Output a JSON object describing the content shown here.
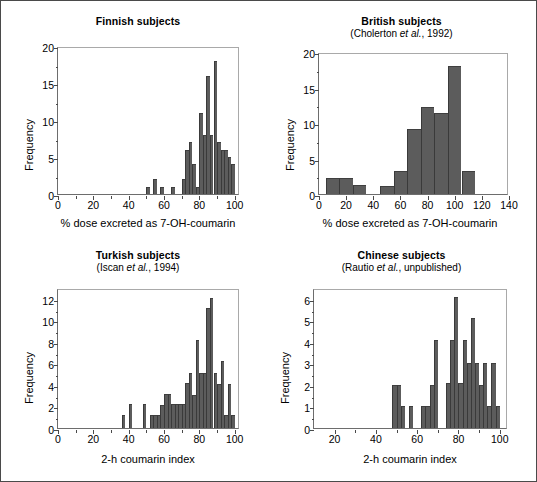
{
  "figure": {
    "background": "#ffffff",
    "border_color": "#4a4a4a",
    "bar_color": "#5c5c5c",
    "bar_edge_color": "#3a3a3a",
    "axis_color": "#4a4a4a"
  },
  "panels": [
    {
      "key": "finnish",
      "title": "Finnish subjects",
      "subtitle": ""
    },
    {
      "key": "british",
      "title": "British subjects",
      "subtitle_prefix": "(Cholerton ",
      "subtitle_italic": "et al.",
      "subtitle_suffix": ", 1992)"
    },
    {
      "key": "turkish",
      "title": "Turkish subjects",
      "subtitle_prefix": "(Iscan ",
      "subtitle_italic": "et al.",
      "subtitle_suffix": ", 1994)"
    },
    {
      "key": "chinese",
      "title": "Chinese subjects",
      "subtitle_prefix": "(Rautio ",
      "subtitle_italic": "et al.",
      "subtitle_suffix": ", unpublished)"
    }
  ],
  "chart_data": [
    {
      "id": "finnish",
      "type": "bar",
      "title": "Finnish subjects",
      "subtitle": "",
      "xlabel": "% dose excreted as 7-OH-coumarin",
      "ylabel": "Frequency",
      "xlim": [
        0,
        103
      ],
      "ylim": [
        0,
        20
      ],
      "xticks": [
        0,
        20,
        40,
        60,
        80,
        100
      ],
      "xticklabels": [
        "0",
        "20",
        "40",
        "60",
        "80",
        "100"
      ],
      "xminorticks": [
        10,
        30,
        50,
        70,
        90
      ],
      "yticks": [
        0,
        5,
        10,
        15,
        20
      ],
      "yticklabels": [
        "0",
        "5",
        "10",
        "15",
        "20"
      ],
      "grid": false,
      "legend": null,
      "bin_width": 2,
      "bins": [
        {
          "x": 50,
          "value": 1
        },
        {
          "x": 54,
          "value": 2
        },
        {
          "x": 58,
          "value": 1
        },
        {
          "x": 64,
          "value": 1
        },
        {
          "x": 70,
          "value": 2
        },
        {
          "x": 72,
          "value": 6
        },
        {
          "x": 74,
          "value": 7
        },
        {
          "x": 76,
          "value": 4
        },
        {
          "x": 78,
          "value": 1
        },
        {
          "x": 80,
          "value": 11
        },
        {
          "x": 82,
          "value": 8
        },
        {
          "x": 84,
          "value": 16
        },
        {
          "x": 86,
          "value": 8
        },
        {
          "x": 88,
          "value": 18
        },
        {
          "x": 90,
          "value": 7
        },
        {
          "x": 92,
          "value": 6
        },
        {
          "x": 94,
          "value": 6
        },
        {
          "x": 96,
          "value": 5
        },
        {
          "x": 98,
          "value": 4
        }
      ]
    },
    {
      "id": "british",
      "type": "bar",
      "title": "British subjects",
      "subtitle": "(Cholerton et al., 1992)",
      "xlabel": "% dose excreted as 7-OH-coumarin",
      "ylabel": "Frequency",
      "xlim": [
        0,
        140
      ],
      "ylim": [
        0,
        20
      ],
      "xticks": [
        0,
        20,
        40,
        60,
        80,
        100,
        120,
        140
      ],
      "xticklabels": [
        "0",
        "20",
        "40",
        "60",
        "80",
        "100",
        "120",
        "140"
      ],
      "yticks": [
        0,
        5,
        10,
        15,
        20
      ],
      "yticklabels": [
        "0",
        "5",
        "10",
        "15",
        "20"
      ],
      "grid": false,
      "legend": null,
      "bin_width": 10,
      "bins": [
        {
          "x": 5,
          "value": 2.2
        },
        {
          "x": 15,
          "value": 2.2
        },
        {
          "x": 25,
          "value": 1.3
        },
        {
          "x": 45,
          "value": 1.1
        },
        {
          "x": 55,
          "value": 3.3
        },
        {
          "x": 65,
          "value": 9.2
        },
        {
          "x": 75,
          "value": 12.3
        },
        {
          "x": 85,
          "value": 11.4
        },
        {
          "x": 95,
          "value": 18.0
        },
        {
          "x": 105,
          "value": 3.3
        }
      ]
    },
    {
      "id": "turkish",
      "type": "bar",
      "title": "Turkish subjects",
      "subtitle": "(Iscan et al., 1994)",
      "xlabel": "2-h coumarin index",
      "ylabel": "Frequency",
      "xlim": [
        0,
        103
      ],
      "ylim": [
        0,
        13
      ],
      "xticks": [
        0,
        20,
        40,
        60,
        80,
        100
      ],
      "xticklabels": [
        "0",
        "20",
        "40",
        "60",
        "80",
        "100"
      ],
      "xminorticks": [
        10,
        30,
        50,
        70,
        90
      ],
      "yticks": [
        0,
        2,
        4,
        6,
        8,
        10,
        12
      ],
      "yticklabels": [
        "0",
        "2",
        "4",
        "6",
        "8",
        "10",
        "12"
      ],
      "grid": false,
      "legend": null,
      "bin_width": 2,
      "bins": [
        {
          "x": 36,
          "value": 1.2
        },
        {
          "x": 40,
          "value": 2.2
        },
        {
          "x": 48,
          "value": 2.2
        },
        {
          "x": 52,
          "value": 1.2
        },
        {
          "x": 54,
          "value": 1.2
        },
        {
          "x": 56,
          "value": 1.2
        },
        {
          "x": 58,
          "value": 2.1
        },
        {
          "x": 60,
          "value": 3.2
        },
        {
          "x": 62,
          "value": 3.2
        },
        {
          "x": 64,
          "value": 2.2
        },
        {
          "x": 66,
          "value": 2.2
        },
        {
          "x": 68,
          "value": 2.2
        },
        {
          "x": 70,
          "value": 2.2
        },
        {
          "x": 72,
          "value": 4.2
        },
        {
          "x": 74,
          "value": 5.1
        },
        {
          "x": 76,
          "value": 3.1
        },
        {
          "x": 78,
          "value": 8.2
        },
        {
          "x": 80,
          "value": 5.1
        },
        {
          "x": 82,
          "value": 5.1
        },
        {
          "x": 84,
          "value": 11.1
        },
        {
          "x": 86,
          "value": 12.1
        },
        {
          "x": 88,
          "value": 5.1
        },
        {
          "x": 90,
          "value": 4.1
        },
        {
          "x": 92,
          "value": 6.2
        },
        {
          "x": 94,
          "value": 1.2
        },
        {
          "x": 96,
          "value": 4.1
        },
        {
          "x": 98,
          "value": 1.2
        }
      ]
    },
    {
      "id": "chinese",
      "type": "bar",
      "title": "Chinese subjects",
      "subtitle": "(Rautio et al., unpublished)",
      "xlabel": "2-h coumarin index",
      "ylabel": "Frequency",
      "xlim": [
        10,
        104
      ],
      "ylim": [
        0,
        6.5
      ],
      "xticks": [
        20,
        40,
        60,
        80,
        100
      ],
      "xticklabels": [
        "20",
        "40",
        "60",
        "80",
        "100"
      ],
      "xminorticks": [
        30,
        50,
        70,
        90
      ],
      "yticks": [
        0,
        1,
        2,
        3,
        4,
        5,
        6
      ],
      "yticklabels": [
        "0",
        "1",
        "2",
        "3",
        "4",
        "5",
        "6"
      ],
      "grid": false,
      "legend": null,
      "bin_width": 2,
      "bins": [
        {
          "x": 48,
          "value": 2.0
        },
        {
          "x": 50,
          "value": 2.0
        },
        {
          "x": 52,
          "value": 1.0
        },
        {
          "x": 56,
          "value": 1.0
        },
        {
          "x": 62,
          "value": 1.0
        },
        {
          "x": 64,
          "value": 1.0
        },
        {
          "x": 66,
          "value": 2.0
        },
        {
          "x": 68,
          "value": 4.1
        },
        {
          "x": 74,
          "value": 2.1
        },
        {
          "x": 76,
          "value": 4.1
        },
        {
          "x": 78,
          "value": 6.1
        },
        {
          "x": 80,
          "value": 2.1
        },
        {
          "x": 82,
          "value": 4.1
        },
        {
          "x": 84,
          "value": 3.0
        },
        {
          "x": 86,
          "value": 5.1
        },
        {
          "x": 88,
          "value": 3.0
        },
        {
          "x": 90,
          "value": 2.0
        },
        {
          "x": 92,
          "value": 3.0
        },
        {
          "x": 94,
          "value": 1.0
        },
        {
          "x": 96,
          "value": 3.0
        },
        {
          "x": 98,
          "value": 1.0
        }
      ]
    }
  ]
}
